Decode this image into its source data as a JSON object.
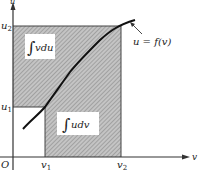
{
  "figure": {
    "axes": {
      "y_label": "u",
      "x_label": "v",
      "origin_label": "O"
    },
    "y_ticks": [
      {
        "label": "u",
        "sub": "2",
        "y": 26
      },
      {
        "label": "u",
        "sub": "1",
        "y": 107
      }
    ],
    "x_ticks": [
      {
        "label": "v",
        "sub": "1",
        "x": 45
      },
      {
        "label": "v",
        "sub": "2",
        "x": 121
      }
    ],
    "curve_label": "u = f(v)",
    "regions": [
      {
        "name": "integral-vdu",
        "label": "∫ vdu",
        "integral": "∫",
        "expr": "vdu"
      },
      {
        "name": "integral-udv",
        "label": "∫ udv",
        "integral": "∫",
        "expr": "udv"
      }
    ],
    "colors": {
      "hatch": "#a8a8a8",
      "axis": "#333333",
      "curve": "#111111",
      "background": "#ffffff"
    }
  }
}
